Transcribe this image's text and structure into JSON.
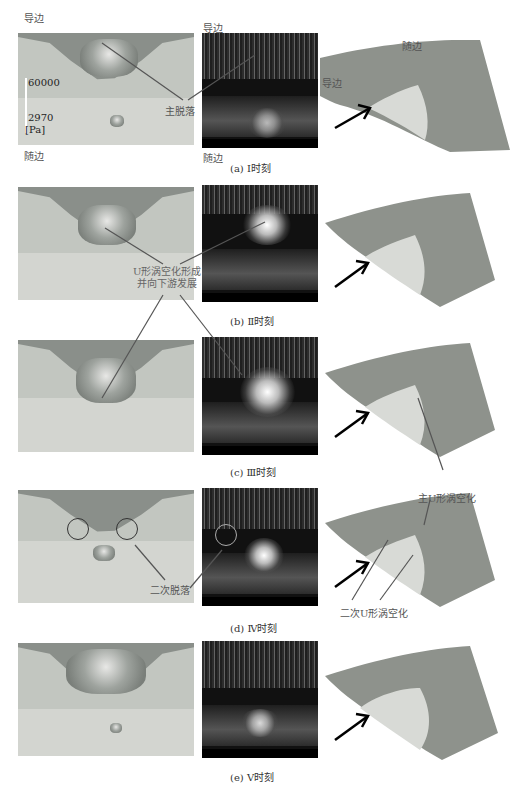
{
  "figure": {
    "panels": [
      {
        "id": "a",
        "caption": "(a) Ⅰ时刻",
        "labels": {
          "leading_edge_left": "导边",
          "trailing_edge_left": "随边",
          "leading_edge_mid": "导边",
          "trailing_edge_mid": "随边",
          "leading_edge_right": "导边",
          "trailing_edge_right": "随边"
        },
        "annotation": "主脱落",
        "legend": {
          "max": "60000",
          "min": "2970",
          "unit": "[Pa]"
        }
      },
      {
        "id": "b",
        "caption": "(b) Ⅱ时刻",
        "annotation_line1": "U形涡空化形成",
        "annotation_line2": "并向下游发展"
      },
      {
        "id": "c",
        "caption": "(c) Ⅲ时刻"
      },
      {
        "id": "d",
        "caption": "(d) Ⅳ时刻",
        "annotation_left": "二次脱落",
        "annotation_right_top": "主U形涡空化",
        "annotation_right_bottom": "二次U形涡空化"
      },
      {
        "id": "e",
        "caption": "(e) Ⅴ时刻"
      }
    ],
    "figure_caption_partial": ""
  },
  "colors": {
    "sim_background": "#c9ccc6",
    "sim_cavity": "#8a8f8a",
    "exp_background": "#111111",
    "blade_surface": "#8e928c",
    "blade_cavity": "#d8dad6",
    "annotation_line": "#555555",
    "flow_arrow": "#000000"
  }
}
